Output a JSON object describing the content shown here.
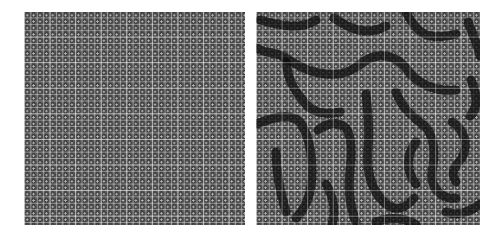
{
  "figure": {
    "panels": [
      {
        "id": "left",
        "description": "Uniform periodic lattice texture (grayscale grid of cells, each with a dark square and a bright center dot)",
        "pattern": "uniform",
        "x": 24,
        "y": 12,
        "width": 221,
        "height": 213
      },
      {
        "id": "right",
        "description": "Same lattice texture modulated by dark meandering labyrinthine stripes",
        "pattern": "labyrinth",
        "x": 256,
        "y": 12,
        "width": 224,
        "height": 213
      }
    ],
    "colors": {
      "background": "#ffffff",
      "lattice_base": "#5a5a5a",
      "grid_lines": "#d7d7d7",
      "dark_stripes": "#0f0f0f"
    }
  }
}
